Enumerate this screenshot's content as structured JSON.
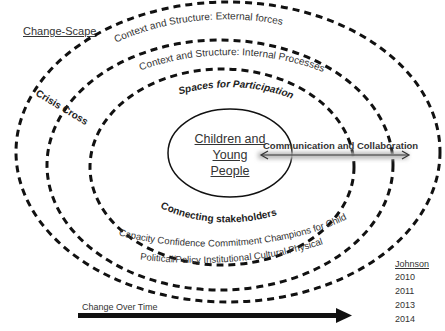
{
  "diagram": {
    "title": "Change-Scape",
    "center": {
      "label_lines": [
        "Children and",
        "Young",
        "People"
      ]
    },
    "rings": {
      "outer_label": "Context and Structure: External forces",
      "second_label": "Context and Structure: Internal Processes",
      "third_top_label": "Spaces for Participation",
      "third_bottom_label": "Connecting stakeholders",
      "cross_cutting_label": "Crisis Cross-Cutting",
      "capacity_items": [
        "Capacity",
        "Confidence",
        "Commitment",
        "Champions for Children"
      ],
      "context_items": [
        "Political/Policy",
        "Institutional",
        "Cultural",
        "Physical"
      ]
    },
    "arrow": {
      "label": "Communication and Collaboration",
      "direction": "bidirectional"
    },
    "timeline": {
      "label": "Change Over Time"
    },
    "legend": {
      "heading": "Johnson",
      "years": [
        "2010",
        "2011",
        "2013",
        "2014"
      ]
    },
    "colors": {
      "line": "#111111",
      "text": "#333333",
      "arrow_glow": "#c8c8c8"
    }
  }
}
